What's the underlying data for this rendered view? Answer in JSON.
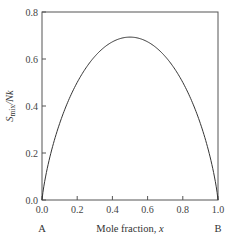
{
  "chart_data": {
    "type": "line",
    "title": "",
    "xlabel": "Mole fraction, x",
    "ylabel": "S_mix/Nk",
    "ylabel_parts": {
      "main": "S",
      "sub": "mix",
      "rest": "/Nk"
    },
    "xlim": [
      0.0,
      1.0
    ],
    "ylim": [
      0.0,
      0.8
    ],
    "grid": false,
    "legend": null,
    "x_ticks": [
      "0.0",
      "0.2",
      "0.4",
      "0.6",
      "0.8",
      "1.0"
    ],
    "y_ticks": [
      "0.0",
      "0.2",
      "0.4",
      "0.6",
      "0.8"
    ],
    "end_labels": {
      "left": "A",
      "right": "B"
    },
    "series": [
      {
        "name": "Entropy of mixing",
        "x": [
          0.0,
          0.02,
          0.05,
          0.1,
          0.15,
          0.2,
          0.25,
          0.3,
          0.35,
          0.4,
          0.45,
          0.5,
          0.55,
          0.6,
          0.65,
          0.7,
          0.75,
          0.8,
          0.85,
          0.9,
          0.95,
          0.98,
          1.0
        ],
        "values": [
          0.0,
          0.098,
          0.199,
          0.325,
          0.423,
          0.5,
          0.562,
          0.611,
          0.647,
          0.673,
          0.688,
          0.693,
          0.688,
          0.673,
          0.647,
          0.611,
          0.562,
          0.5,
          0.423,
          0.325,
          0.199,
          0.098,
          0.0
        ]
      }
    ]
  }
}
